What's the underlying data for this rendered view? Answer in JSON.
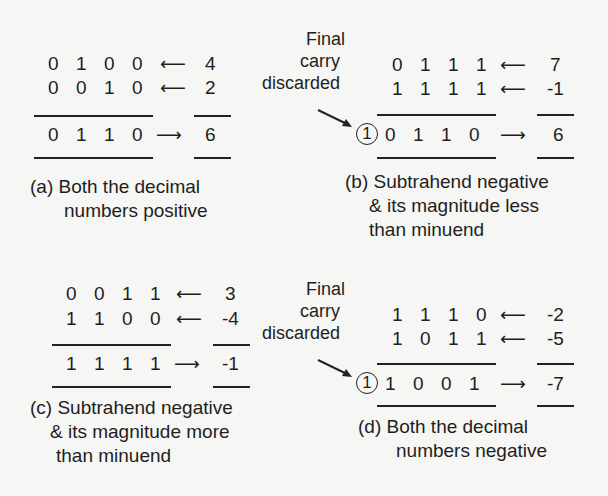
{
  "panels": [
    {
      "id": "a",
      "row1": {
        "bits": [
          "0",
          "1",
          "0",
          "0"
        ],
        "arrow": "⟵",
        "decimal": "4"
      },
      "row2": {
        "bits": [
          "0",
          "0",
          "1",
          "0"
        ],
        "arrow": "⟵",
        "decimal": "2"
      },
      "result": {
        "carry": null,
        "bits": [
          "0",
          "1",
          "1",
          "0"
        ],
        "arrow": "⟶",
        "decimal": "6"
      },
      "caption_line1": "(a) Both the decimal",
      "caption_line2": "numbers positive"
    },
    {
      "id": "b",
      "note_line1": "Final",
      "note_line2": "carry",
      "note_line3": "discarded",
      "row1": {
        "bits": [
          "0",
          "1",
          "1",
          "1"
        ],
        "arrow": "⟵",
        "decimal": "7"
      },
      "row2": {
        "bits": [
          "1",
          "1",
          "1",
          "1"
        ],
        "arrow": "⟵",
        "decimal": "-1"
      },
      "result": {
        "carry": "1",
        "bits": [
          "0",
          "1",
          "1",
          "0"
        ],
        "arrow": "⟶",
        "decimal": "6"
      },
      "caption_line1": "(b) Subtrahend negative",
      "caption_line2": "& its magnitude less",
      "caption_line3": "than minuend"
    },
    {
      "id": "c",
      "row1": {
        "bits": [
          "0",
          "0",
          "1",
          "1"
        ],
        "arrow": "⟵",
        "decimal": "3"
      },
      "row2": {
        "bits": [
          "1",
          "1",
          "0",
          "0"
        ],
        "arrow": "⟵",
        "decimal": "-4"
      },
      "result": {
        "carry": null,
        "bits": [
          "1",
          "1",
          "1",
          "1"
        ],
        "arrow": "⟶",
        "decimal": "-1"
      },
      "caption_line1": "(c) Subtrahend negative",
      "caption_line2": "& its magnitude more",
      "caption_line3": "than minuend"
    },
    {
      "id": "d",
      "note_line1": "Final",
      "note_line2": "carry",
      "note_line3": "discarded",
      "row1": {
        "bits": [
          "1",
          "1",
          "1",
          "0"
        ],
        "arrow": "⟵",
        "decimal": "-2"
      },
      "row2": {
        "bits": [
          "1",
          "0",
          "1",
          "1"
        ],
        "arrow": "⟵",
        "decimal": "-5"
      },
      "result": {
        "carry": "1",
        "bits": [
          "1",
          "0",
          "0",
          "1"
        ],
        "arrow": "⟶",
        "decimal": "-7"
      },
      "caption_line1": "(d) Both the decimal",
      "caption_line2": "numbers negative"
    }
  ]
}
